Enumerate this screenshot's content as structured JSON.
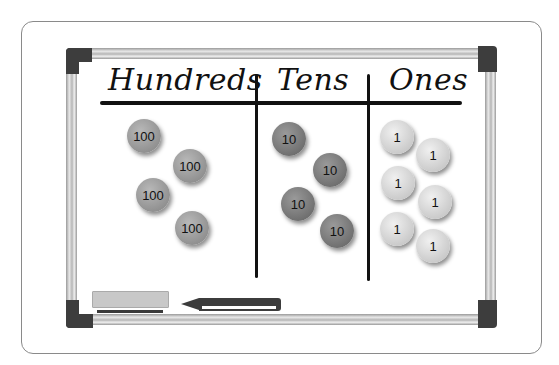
{
  "diagram": {
    "columns": [
      {
        "heading": "Hundreds",
        "coins": [
          "100",
          "100",
          "100",
          "100"
        ]
      },
      {
        "heading": "Tens",
        "coins": [
          "10",
          "10",
          "10",
          "10"
        ]
      },
      {
        "heading": "Ones",
        "coins": [
          "1",
          "1",
          "1",
          "1",
          "1",
          "1"
        ]
      }
    ],
    "colors": {
      "hundreds_coin": "#a3a3a3",
      "tens_coin": "#838383",
      "ones_coin": "#dedede",
      "frame_corner": "#3d3d3d",
      "ink": "#111111"
    }
  }
}
